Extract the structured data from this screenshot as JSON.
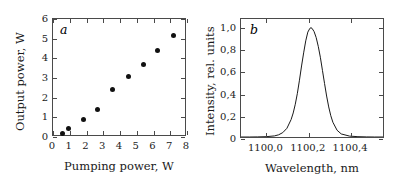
{
  "figure": {
    "background_color": "#ffffff",
    "line_color": "#4a4a4a",
    "marker_color": "#111111",
    "curve_color": "#1a1a1a"
  },
  "chart_data": [
    {
      "type": "scatter",
      "panel_label": "a",
      "title": "",
      "xlabel": "Pumping power, W",
      "ylabel": "Output power, W",
      "xlim": [
        0,
        8
      ],
      "ylim": [
        0,
        6
      ],
      "xticks": [
        0,
        1,
        2,
        3,
        4,
        5,
        6,
        7,
        8
      ],
      "xtick_labels": [
        "0",
        "1",
        "2",
        "3",
        "4",
        "5",
        "6",
        "7",
        "8"
      ],
      "yticks": [
        0,
        1,
        2,
        3,
        4,
        5,
        6
      ],
      "ytick_labels": [
        "0",
        "1",
        "2",
        "3",
        "4",
        "5",
        "6"
      ],
      "grid": false,
      "legend": "none",
      "marker": "filled-circle",
      "points": [
        {
          "x": 0.58,
          "y": 0.18
        },
        {
          "x": 0.9,
          "y": 0.42
        },
        {
          "x": 1.82,
          "y": 0.9
        },
        {
          "x": 2.68,
          "y": 1.4
        },
        {
          "x": 3.58,
          "y": 2.4
        },
        {
          "x": 4.48,
          "y": 3.08
        },
        {
          "x": 5.38,
          "y": 3.68
        },
        {
          "x": 6.26,
          "y": 4.38
        },
        {
          "x": 7.2,
          "y": 5.15
        }
      ]
    },
    {
      "type": "line",
      "panel_label": "b",
      "title": "",
      "xlabel": "Wavelength, nm",
      "ylabel": "Intensity, rel. units",
      "xlim": [
        1099.88,
        1100.56
      ],
      "ylim": [
        0,
        1.08
      ],
      "xticks": [
        1100.0,
        1100.2,
        1100.4
      ],
      "xtick_labels": [
        "1100,0",
        "1100,2",
        "1100,4"
      ],
      "yticks": [
        0,
        0.2,
        0.4,
        0.6,
        0.8,
        1.0
      ],
      "ytick_labels": [
        "0",
        "0,2",
        "0,4",
        "0,6",
        "0,8",
        "1,0"
      ],
      "grid": false,
      "legend": "none",
      "peak_center_nm": 1100.215,
      "peak_height": 1.0,
      "fwhm_nm": 0.055,
      "series": [
        {
          "name": "emission spectrum",
          "x": [
            1099.88,
            1099.92,
            1099.96,
            1100.0,
            1100.04,
            1100.06,
            1100.08,
            1100.1,
            1100.12,
            1100.13,
            1100.14,
            1100.15,
            1100.16,
            1100.17,
            1100.18,
            1100.19,
            1100.2,
            1100.21,
            1100.215,
            1100.22,
            1100.23,
            1100.24,
            1100.25,
            1100.26,
            1100.27,
            1100.28,
            1100.29,
            1100.3,
            1100.31,
            1100.32,
            1100.34,
            1100.36,
            1100.4,
            1100.44,
            1100.48,
            1100.52,
            1100.56
          ],
          "y": [
            0.0,
            0.0,
            0.001,
            0.003,
            0.01,
            0.02,
            0.04,
            0.08,
            0.16,
            0.22,
            0.3,
            0.4,
            0.52,
            0.65,
            0.77,
            0.88,
            0.96,
            0.995,
            1.0,
            0.995,
            0.965,
            0.91,
            0.83,
            0.73,
            0.61,
            0.49,
            0.375,
            0.275,
            0.195,
            0.135,
            0.062,
            0.028,
            0.008,
            0.003,
            0.001,
            0.0,
            0.0
          ]
        }
      ]
    }
  ]
}
